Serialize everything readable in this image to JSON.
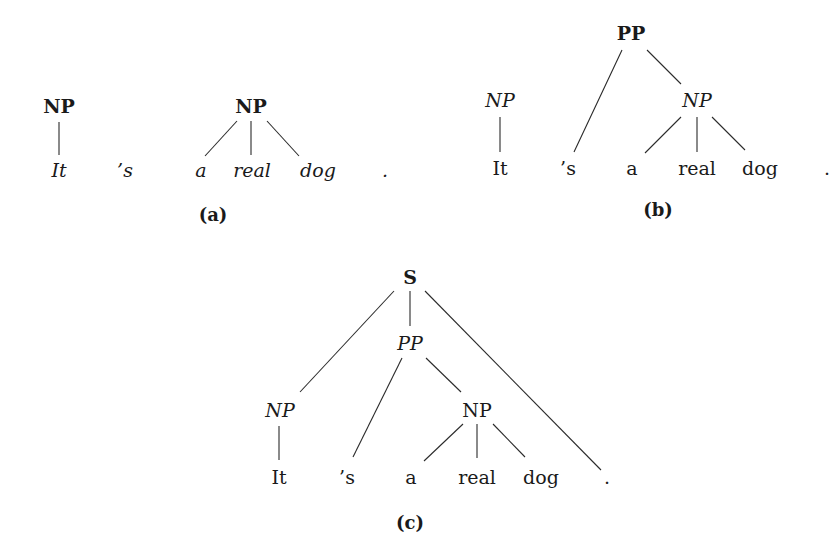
{
  "figure": {
    "panels": [
      {
        "id": "a",
        "caption": "(a)",
        "nodes": [
          {
            "label": "NP",
            "style": "bold",
            "x": 59,
            "y": 106
          },
          {
            "label": "NP",
            "style": "bold",
            "x": 251,
            "y": 106
          }
        ],
        "leaves": [
          {
            "label": "It",
            "style": "italic",
            "x": 59,
            "y": 170
          },
          {
            "label": "’s",
            "style": "italic",
            "x": 125,
            "y": 170
          },
          {
            "label": "a",
            "style": "italic",
            "x": 201,
            "y": 170
          },
          {
            "label": "real",
            "style": "italic",
            "x": 252,
            "y": 170
          },
          {
            "label": "dog",
            "style": "italic",
            "x": 318,
            "y": 170
          },
          {
            "label": ".",
            "style": "italic",
            "x": 385,
            "y": 170
          }
        ],
        "caption_pos": {
          "x": 213,
          "y": 215
        },
        "edges": [
          [
            59,
            122,
            59,
            155
          ],
          [
            237,
            121,
            205,
            156
          ],
          [
            251,
            121,
            251,
            155
          ],
          [
            267,
            121,
            299,
            156
          ]
        ]
      },
      {
        "id": "b",
        "caption": "(b)",
        "nodes": [
          {
            "label": "PP",
            "style": "bold",
            "x": 631,
            "y": 33
          },
          {
            "label": "NP",
            "style": "italic",
            "x": 500,
            "y": 100
          },
          {
            "label": "NP",
            "style": "italic",
            "x": 697,
            "y": 100
          }
        ],
        "leaves": [
          {
            "label": "It",
            "style": "roman",
            "x": 500,
            "y": 168
          },
          {
            "label": "’s",
            "style": "roman",
            "x": 568,
            "y": 168
          },
          {
            "label": "a",
            "style": "roman",
            "x": 632,
            "y": 168
          },
          {
            "label": "real",
            "style": "roman",
            "x": 697,
            "y": 168
          },
          {
            "label": "dog",
            "style": "roman",
            "x": 760,
            "y": 168
          },
          {
            "label": ".",
            "style": "roman",
            "x": 827,
            "y": 168
          }
        ],
        "caption_pos": {
          "x": 658,
          "y": 210
        },
        "edges": [
          [
            500,
            117,
            500,
            152
          ],
          [
            622,
            50,
            574,
            152
          ],
          [
            647,
            50,
            681,
            84
          ],
          [
            681,
            117,
            645,
            153
          ],
          [
            697,
            117,
            697,
            152
          ],
          [
            712,
            117,
            745,
            150
          ]
        ]
      },
      {
        "id": "c",
        "caption": "(c)",
        "nodes": [
          {
            "label": "S",
            "style": "bold",
            "x": 410,
            "y": 277
          },
          {
            "label": "PP",
            "style": "italic",
            "x": 410,
            "y": 343
          },
          {
            "label": "NP",
            "style": "italic",
            "x": 280,
            "y": 410
          },
          {
            "label": "NP",
            "style": "roman",
            "x": 477,
            "y": 410
          }
        ],
        "leaves": [
          {
            "label": "It",
            "style": "roman",
            "x": 279,
            "y": 477
          },
          {
            "label": "’s",
            "style": "roman",
            "x": 347,
            "y": 477
          },
          {
            "label": "a",
            "style": "roman",
            "x": 411,
            "y": 477
          },
          {
            "label": "real",
            "style": "roman",
            "x": 477,
            "y": 477
          },
          {
            "label": "dog",
            "style": "roman",
            "x": 541,
            "y": 477
          },
          {
            "label": ".",
            "style": "roman",
            "x": 607,
            "y": 477
          }
        ],
        "caption_pos": {
          "x": 410,
          "y": 523
        },
        "edges": [
          [
            394,
            291,
            300,
            392
          ],
          [
            410,
            291,
            410,
            326
          ],
          [
            425,
            291,
            601,
            470
          ],
          [
            402,
            358,
            353,
            457
          ],
          [
            426,
            358,
            461,
            392
          ],
          [
            463,
            424,
            424,
            461
          ],
          [
            477,
            424,
            477,
            458
          ],
          [
            493,
            424,
            525,
            457
          ],
          [
            279,
            426,
            279,
            460
          ]
        ]
      }
    ]
  }
}
